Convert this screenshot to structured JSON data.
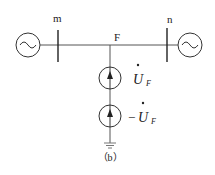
{
  "diagram": {
    "bus_m_label": "m",
    "bus_n_label": "n",
    "fault_label": "F",
    "source1_label": "U",
    "source1_sub": "F",
    "source2_prefix": "−",
    "source2_label": "U",
    "source2_sub": "F",
    "caption": "（b）",
    "line_color": "#333333"
  }
}
